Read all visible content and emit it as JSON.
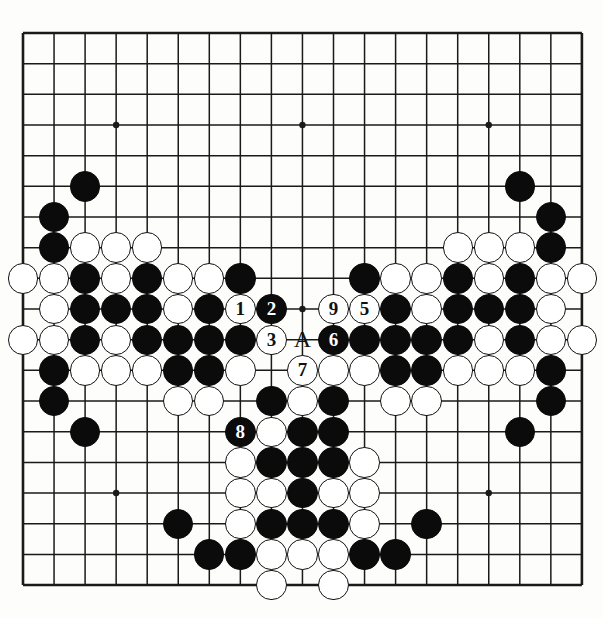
{
  "diagram": {
    "type": "go-board",
    "board_size": 19,
    "geometry": {
      "left": 23,
      "top": 33,
      "col_spacing": 31.05,
      "row_spacing": 30.67,
      "stone_radius": 15.2,
      "star_radius": 3.2
    },
    "star_points": [
      [
        3,
        3
      ],
      [
        9,
        3
      ],
      [
        15,
        3
      ],
      [
        3,
        9
      ],
      [
        9,
        9
      ],
      [
        15,
        9
      ],
      [
        3,
        15
      ],
      [
        9,
        15
      ],
      [
        15,
        15
      ]
    ],
    "black_stones": [
      [
        2,
        5
      ],
      [
        16,
        5
      ],
      [
        1,
        6
      ],
      [
        17,
        6
      ],
      [
        1,
        7
      ],
      [
        17,
        7
      ],
      [
        2,
        8
      ],
      [
        4,
        8
      ],
      [
        7,
        8
      ],
      [
        11,
        8
      ],
      [
        14,
        8
      ],
      [
        16,
        8
      ],
      [
        2,
        9
      ],
      [
        3,
        9
      ],
      [
        4,
        9
      ],
      [
        6,
        9
      ],
      [
        12,
        9
      ],
      [
        14,
        9
      ],
      [
        15,
        9
      ],
      [
        16,
        9
      ],
      [
        2,
        10
      ],
      [
        4,
        10
      ],
      [
        5,
        10
      ],
      [
        6,
        10
      ],
      [
        7,
        10
      ],
      [
        11,
        10
      ],
      [
        12,
        10
      ],
      [
        13,
        10
      ],
      [
        14,
        10
      ],
      [
        16,
        10
      ],
      [
        1,
        11
      ],
      [
        5,
        11
      ],
      [
        6,
        11
      ],
      [
        12,
        11
      ],
      [
        13,
        11
      ],
      [
        17,
        11
      ],
      [
        1,
        12
      ],
      [
        8,
        12
      ],
      [
        10,
        12
      ],
      [
        17,
        12
      ],
      [
        2,
        13
      ],
      [
        9,
        13
      ],
      [
        10,
        13
      ],
      [
        16,
        13
      ],
      [
        8,
        14
      ],
      [
        9,
        14
      ],
      [
        10,
        14
      ],
      [
        9,
        15
      ],
      [
        5,
        16
      ],
      [
        8,
        16
      ],
      [
        9,
        16
      ],
      [
        10,
        16
      ],
      [
        13,
        16
      ],
      [
        6,
        17
      ],
      [
        7,
        17
      ],
      [
        11,
        17
      ],
      [
        12,
        17
      ]
    ],
    "white_stones": [
      [
        2,
        7
      ],
      [
        3,
        7
      ],
      [
        4,
        7
      ],
      [
        14,
        7
      ],
      [
        15,
        7
      ],
      [
        16,
        7
      ],
      [
        0,
        8
      ],
      [
        1,
        8
      ],
      [
        3,
        8
      ],
      [
        5,
        8
      ],
      [
        6,
        8
      ],
      [
        12,
        8
      ],
      [
        13,
        8
      ],
      [
        15,
        8
      ],
      [
        17,
        8
      ],
      [
        18,
        8
      ],
      [
        1,
        9
      ],
      [
        5,
        9
      ],
      [
        13,
        9
      ],
      [
        17,
        9
      ],
      [
        0,
        10
      ],
      [
        1,
        10
      ],
      [
        3,
        10
      ],
      [
        15,
        10
      ],
      [
        17,
        10
      ],
      [
        18,
        10
      ],
      [
        2,
        11
      ],
      [
        3,
        11
      ],
      [
        4,
        11
      ],
      [
        7,
        11
      ],
      [
        10,
        11
      ],
      [
        11,
        11
      ],
      [
        14,
        11
      ],
      [
        15,
        11
      ],
      [
        16,
        11
      ],
      [
        5,
        12
      ],
      [
        6,
        12
      ],
      [
        9,
        12
      ],
      [
        12,
        12
      ],
      [
        13,
        12
      ],
      [
        8,
        13
      ],
      [
        7,
        14
      ],
      [
        11,
        14
      ],
      [
        7,
        15
      ],
      [
        8,
        15
      ],
      [
        10,
        15
      ],
      [
        11,
        15
      ],
      [
        7,
        16
      ],
      [
        11,
        16
      ],
      [
        8,
        17
      ],
      [
        9,
        17
      ],
      [
        10,
        17
      ],
      [
        8,
        18
      ],
      [
        10,
        18
      ]
    ],
    "numbered_moves": [
      {
        "label": "1",
        "color": "white",
        "col": 7,
        "row": 9
      },
      {
        "label": "2",
        "color": "black",
        "col": 8,
        "row": 9
      },
      {
        "label": "3",
        "color": "white",
        "col": 8,
        "row": 10
      },
      {
        "label": "5",
        "color": "white",
        "col": 11,
        "row": 9
      },
      {
        "label": "6",
        "color": "black",
        "col": 10,
        "row": 10
      },
      {
        "label": "7",
        "color": "white",
        "col": 9,
        "row": 11
      },
      {
        "label": "8",
        "color": "black",
        "col": 7,
        "row": 13
      },
      {
        "label": "9",
        "color": "white",
        "col": 10,
        "row": 9
      }
    ],
    "point_labels": [
      {
        "label": "A",
        "col": 9,
        "row": 10
      }
    ],
    "colors": {
      "black_stone": "#0b0b0b",
      "white_stone": "#ffffff",
      "line": "#1a1a1a",
      "background": "#fdfdfb",
      "label_text": "#111111"
    }
  }
}
